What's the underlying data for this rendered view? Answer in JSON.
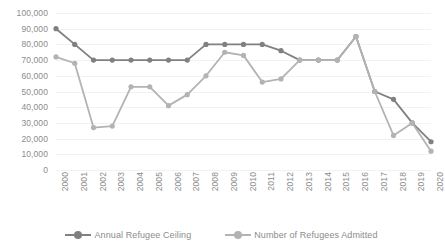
{
  "chart_data": {
    "type": "line",
    "title": "",
    "subtitle": "",
    "xlabel": "",
    "ylabel": "",
    "x": [
      "2000",
      "2001",
      "2002",
      "2003",
      "2004",
      "2005",
      "2006",
      "2007",
      "2008",
      "2009",
      "2010",
      "2011",
      "2012",
      "2013",
      "2014",
      "2015",
      "2016",
      "2017",
      "2018",
      "2019",
      "2020"
    ],
    "categories": [
      "2000",
      "2001",
      "2002",
      "2003",
      "2004",
      "2005",
      "2006",
      "2007",
      "2008",
      "2009",
      "2010",
      "2011",
      "2012",
      "2013",
      "2014",
      "2015",
      "2016",
      "2017",
      "2018",
      "2019",
      "2020"
    ],
    "series": [
      {
        "name": "Annual Refugee Ceiling",
        "color": "#808080",
        "values": [
          90000,
          80000,
          70000,
          70000,
          70000,
          70000,
          70000,
          70000,
          80000,
          80000,
          80000,
          80000,
          76000,
          70000,
          70000,
          70000,
          85000,
          50000,
          45000,
          30000,
          18000
        ]
      },
      {
        "name": "Number of Refugees Admitted",
        "color": "#b3b3b3",
        "values": [
          72000,
          68000,
          27000,
          28000,
          53000,
          53000,
          41000,
          48000,
          60000,
          75000,
          73000,
          56000,
          58000,
          70000,
          70000,
          70000,
          85000,
          50000,
          22000,
          30000,
          12000
        ]
      }
    ],
    "ylim": [
      0,
      100000
    ],
    "y_ticks": [
      "0",
      "10,000",
      "20,000",
      "30,000",
      "40,000",
      "50,000",
      "60,000",
      "70,000",
      "80,000",
      "90,000",
      "100,000"
    ],
    "y_tick_values": [
      0,
      10000,
      20000,
      30000,
      40000,
      50000,
      60000,
      70000,
      80000,
      90000,
      100000
    ],
    "grid": true,
    "legend_position": "bottom",
    "marker": "circle"
  },
  "legend": {
    "items": [
      {
        "label": "Annual Refugee Ceiling",
        "color": "#808080"
      },
      {
        "label": "Number of Refugees Admitted",
        "color": "#b3b3b3"
      }
    ]
  },
  "colors": {
    "ceiling": "#808080",
    "admitted": "#b3b3b3",
    "gridline": "#f2f2f2",
    "axis_text": "#8c8c8c",
    "background": "#ffffff"
  }
}
